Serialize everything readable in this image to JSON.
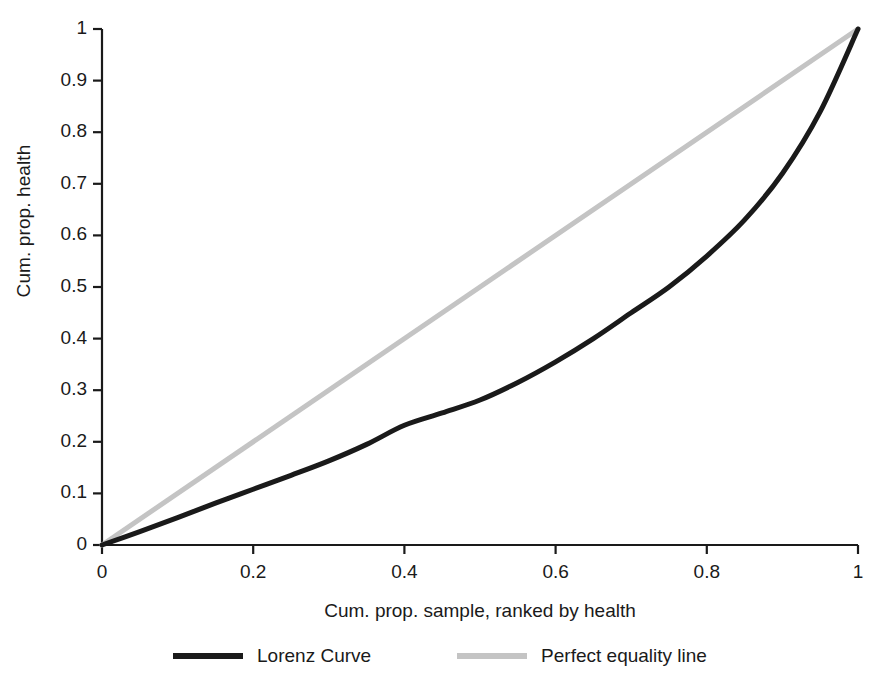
{
  "chart_data": {
    "type": "line",
    "title": "",
    "xlabel": "Cum. prop. sample, ranked by health",
    "ylabel": "Cum. prop. health",
    "xlim": [
      0,
      1
    ],
    "ylim": [
      0,
      1
    ],
    "grid": false,
    "legend_position": "bottom",
    "xticks": [
      "0",
      "0.2",
      "0.4",
      "0.6",
      "0.8",
      "1"
    ],
    "xtick_values": [
      0,
      0.2,
      0.4,
      0.6,
      0.8,
      1
    ],
    "yticks": [
      "0",
      "0.1",
      "0.2",
      "0.3",
      "0.4",
      "0.5",
      "0.6",
      "0.7",
      "0.8",
      "0.9",
      "1"
    ],
    "ytick_values": [
      0,
      0.1,
      0.2,
      0.3,
      0.4,
      0.5,
      0.6,
      0.7,
      0.8,
      0.9,
      1
    ],
    "series": [
      {
        "name": "Lorenz Curve",
        "color": "#1a1a1a",
        "linewidth": 5,
        "x": [
          0,
          0.05,
          0.1,
          0.15,
          0.2,
          0.25,
          0.3,
          0.35,
          0.4,
          0.45,
          0.5,
          0.55,
          0.6,
          0.65,
          0.7,
          0.75,
          0.8,
          0.85,
          0.9,
          0.95,
          1
        ],
        "values": [
          0,
          0.026,
          0.053,
          0.081,
          0.108,
          0.135,
          0.163,
          0.195,
          0.232,
          0.256,
          0.281,
          0.315,
          0.355,
          0.4,
          0.45,
          0.5,
          0.56,
          0.63,
          0.72,
          0.84,
          1
        ]
      },
      {
        "name": "Perfect equality line",
        "color": "#c4c4c4",
        "linewidth": 5,
        "x": [
          0,
          1
        ],
        "values": [
          0,
          1
        ]
      }
    ]
  },
  "legend": {
    "items": [
      {
        "label": "Lorenz Curve",
        "color": "#1a1a1a"
      },
      {
        "label": "Perfect equality line",
        "color": "#c4c4c4"
      }
    ]
  }
}
